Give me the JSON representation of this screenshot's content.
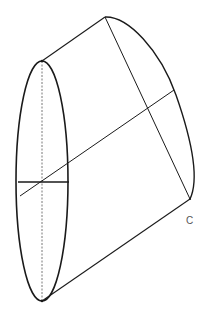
{
  "diagram": {
    "type": "geometric-figure",
    "colors": {
      "background": "#ffffff",
      "stroke": "#1a1a1a",
      "label": "#555555"
    },
    "labels": {
      "point_c": "C"
    },
    "elements": [
      {
        "name": "near-ellipse",
        "kind": "ellipse",
        "cx": 42,
        "cy": 181,
        "rx": 26,
        "ry": 120
      },
      {
        "name": "top-generator",
        "kind": "line",
        "from": [
          42,
          61
        ],
        "to": [
          105,
          17
        ]
      },
      {
        "name": "bottom-generator",
        "kind": "line",
        "from": [
          42,
          301
        ],
        "to": [
          190,
          199
        ]
      },
      {
        "name": "far-curved-edge",
        "kind": "curve",
        "from": [
          105,
          17
        ],
        "through": [
          [
            174,
            90
          ],
          [
            196,
            170
          ]
        ],
        "to": [
          190,
          199
        ]
      },
      {
        "name": "chord-to-c",
        "kind": "line",
        "from": [
          105,
          17
        ],
        "to": [
          190,
          199
        ]
      },
      {
        "name": "central-axis",
        "kind": "line",
        "from": [
          20,
          196
        ],
        "to": [
          174,
          90
        ]
      },
      {
        "name": "horizontal-diameter",
        "kind": "line",
        "from": [
          18,
          182
        ],
        "to": [
          69,
          182
        ]
      },
      {
        "name": "vertical-diameter",
        "kind": "dashed-line",
        "from": [
          42,
          61
        ],
        "to": [
          42,
          301
        ]
      }
    ]
  }
}
